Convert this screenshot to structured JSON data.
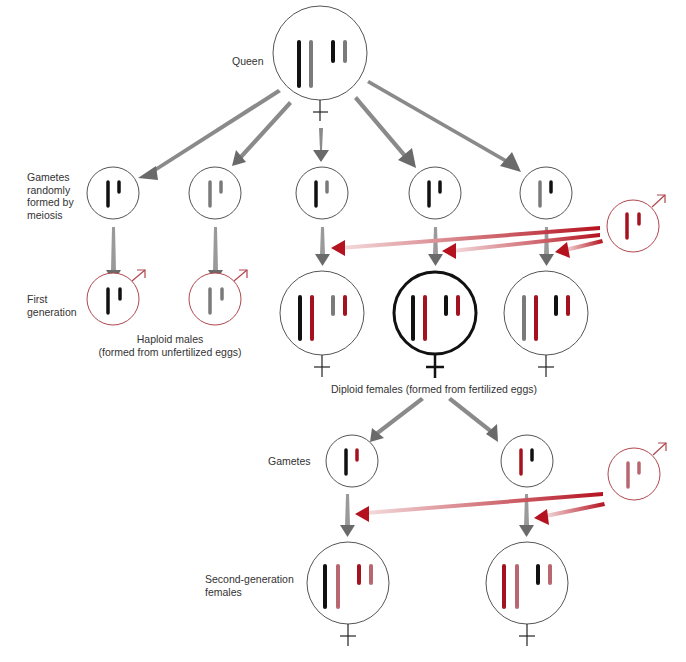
{
  "colors": {
    "black_chrom": "#111111",
    "gray_chrom": "#7a7a7a",
    "red_chrom": "#a3121e",
    "pink_chrom": "#b86670",
    "circle_stroke": "#555555",
    "male_stroke": "#b0474e",
    "gray_arrow": "#6e6e6e",
    "red_arrow": "#b5121f"
  },
  "labels": {
    "queen": "Queen",
    "gametes_meiosis": [
      "Gametes",
      "randomly",
      "formed by",
      "meiosis"
    ],
    "first_generation": [
      "First",
      "generation"
    ],
    "haploid_males": [
      "Haploid males",
      "(formed from unfertilized eggs)"
    ],
    "diploid_females": "Diploid females (formed from fertilized eggs)",
    "gametes": "Gametes",
    "second_generation": [
      "Second-generation",
      "females"
    ]
  },
  "symbols": {
    "female": "♀",
    "male": "♂"
  },
  "nodes": {
    "queen": {
      "x": 320,
      "y": 53,
      "r": 47,
      "sex": "female",
      "chromosomes": [
        "black-long",
        "gray-long",
        "black-short",
        "gray-short"
      ]
    },
    "gametes_gen1": [
      {
        "x": 113,
        "y": 193,
        "chromosomes": [
          "black-long",
          "black-short"
        ]
      },
      {
        "x": 215,
        "y": 193,
        "chromosomes": [
          "gray-long",
          "gray-short"
        ]
      },
      {
        "x": 322,
        "y": 193,
        "chromosomes": [
          "black-long",
          "gray-short"
        ]
      },
      {
        "x": 435,
        "y": 193,
        "chromosomes": [
          "black-long",
          "black-short"
        ]
      },
      {
        "x": 546,
        "y": 193,
        "chromosomes": [
          "gray-long",
          "black-short"
        ]
      }
    ],
    "father_drone_1": {
      "x": 633,
      "y": 226,
      "chromosomes": [
        "red-long",
        "red-short"
      ]
    },
    "haploid_males": [
      {
        "x": 113,
        "y": 299,
        "chromosomes": [
          "black-long",
          "black-short"
        ]
      },
      {
        "x": 215,
        "y": 299,
        "chromosomes": [
          "gray-long",
          "gray-short"
        ]
      }
    ],
    "diploid_females": [
      {
        "x": 322,
        "y": 313,
        "emphasized": false,
        "chromosomes": [
          "black-long",
          "red-long",
          "gray-short",
          "red-short"
        ]
      },
      {
        "x": 435,
        "y": 313,
        "emphasized": true,
        "chromosomes": [
          "black-long",
          "red-long",
          "black-short",
          "red-short"
        ]
      },
      {
        "x": 546,
        "y": 313,
        "emphasized": false,
        "chromosomes": [
          "gray-long",
          "red-long",
          "black-short",
          "red-short"
        ]
      }
    ],
    "gametes_gen2": [
      {
        "x": 352,
        "y": 461,
        "chromosomes": [
          "black-long",
          "red-short"
        ]
      },
      {
        "x": 527,
        "y": 461,
        "chromosomes": [
          "red-long",
          "black-short"
        ]
      }
    ],
    "father_drone_2": {
      "x": 634,
      "y": 474,
      "chromosomes": [
        "pink-long",
        "pink-short"
      ]
    },
    "second_generation_females": [
      {
        "x": 348,
        "y": 583,
        "chromosomes": [
          "black-long",
          "pink-long",
          "red-short",
          "pink-short"
        ]
      },
      {
        "x": 527,
        "y": 583,
        "chromosomes": [
          "red-long",
          "pink-long",
          "black-short",
          "pink-short"
        ]
      }
    ]
  }
}
